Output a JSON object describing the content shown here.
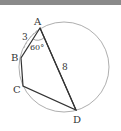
{
  "diagram": {
    "type": "cyclic quadrilateral inscribed in circle",
    "vertices": {
      "A": {
        "label": "A"
      },
      "B": {
        "label": "B"
      },
      "C": {
        "label": "C"
      },
      "D": {
        "label": "D"
      }
    },
    "labels": {
      "side_ab": "3",
      "angle_bad": "60°",
      "diagonal_ad": "8"
    },
    "colors": {
      "circle": "#999999",
      "edges": "#333333",
      "arc": "#aaaaaa",
      "topbar": "#8a8a8a"
    }
  }
}
